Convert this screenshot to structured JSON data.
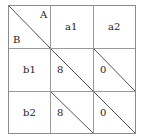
{
  "table": {
    "corner": {
      "top_right": "A",
      "bottom_left": "B"
    },
    "column_headers": [
      "a1",
      "a2"
    ],
    "row_headers": [
      "b1",
      "b2"
    ],
    "cells": [
      [
        "8",
        "0"
      ],
      [
        "8",
        "0"
      ]
    ]
  }
}
